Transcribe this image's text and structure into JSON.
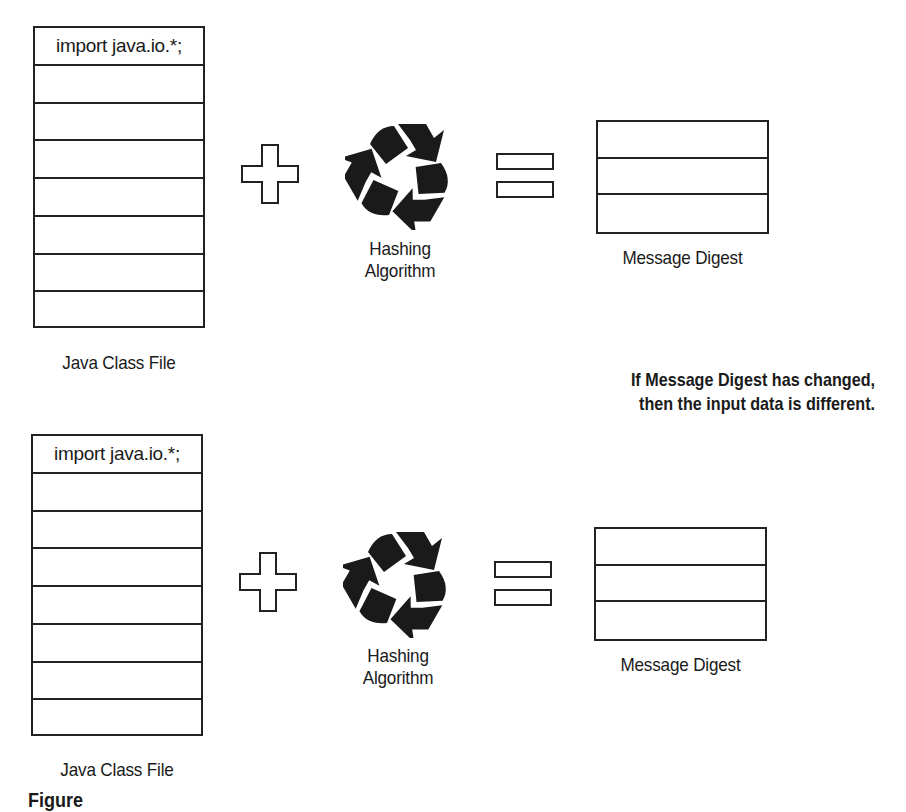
{
  "diagram": {
    "panels": [
      {
        "class_file": {
          "first_line": "import java.io.*;",
          "blank_rows": 7,
          "label": "Java Class File"
        },
        "operator_plus": "plus-icon",
        "algorithm": {
          "icon": "recycle-icon",
          "label_line1": "Hashing",
          "label_line2": "Algorithm"
        },
        "operator_equals": "equals-icon",
        "digest": {
          "rows": 3,
          "label": "Message Digest"
        }
      },
      {
        "class_file": {
          "first_line": "import java.io.*;",
          "blank_rows": 7,
          "label": "Java Class File"
        },
        "operator_plus": "plus-icon",
        "algorithm": {
          "icon": "recycle-icon",
          "label_line1": "Hashing",
          "label_line2": "Algorithm"
        },
        "operator_equals": "equals-icon",
        "digest": {
          "rows": 3,
          "label": "Message Digest"
        }
      }
    ],
    "note": {
      "line1": "If Message Digest has changed,",
      "line2": "then the input data is different."
    },
    "caption_clipped": "Figure"
  },
  "colors": {
    "stroke": "#222222",
    "background": "#ffffff",
    "text": "#1a1a1a"
  }
}
